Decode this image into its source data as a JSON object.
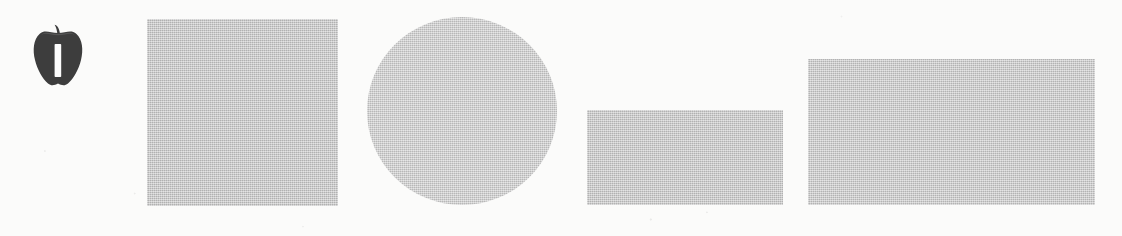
{
  "page": {
    "background_color": "#fbfbfa",
    "width": 1122,
    "height": 236,
    "baseline_y": 205
  },
  "marker": {
    "name": "apple-icon",
    "icon": "apple-icon",
    "description": "Dark apple illustration with a white vertical bar cut out of its center",
    "fill_color": "#3d3d3d",
    "cutout_color": "#fcfcfc",
    "cutout_glyph": "I",
    "x": 34,
    "y": 25,
    "width": 46,
    "height": 63
  },
  "shapes": [
    {
      "name": "square",
      "label": "square",
      "fill_color": "#c2c2c2",
      "x": 147,
      "y": 19,
      "width": 191,
      "height": 187
    },
    {
      "name": "circle",
      "label": "circle",
      "fill_color": "#c9c9c9",
      "x": 367,
      "y": 17,
      "width": 190,
      "height": 188,
      "diameter": 190
    },
    {
      "name": "rectangle-small",
      "label": "rectangle",
      "fill_color": "#c3c3c3",
      "x": 587,
      "y": 110,
      "width": 196,
      "height": 95
    },
    {
      "name": "rectangle-large",
      "label": "rectangle",
      "fill_color": "#c5c5c5",
      "x": 808,
      "y": 59,
      "width": 287,
      "height": 146
    }
  ]
}
